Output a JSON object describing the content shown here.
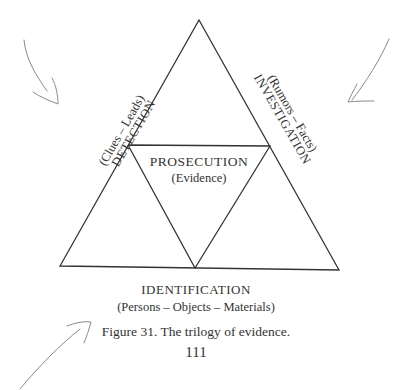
{
  "diagram": {
    "type": "triangle-subdivided",
    "inner_label": {
      "title": "PROSECUTION",
      "subtitle": "(Evidence)"
    },
    "left_side": {
      "title": "DETECTION",
      "subtitle": "(Clues – Leads)"
    },
    "right_side": {
      "title": "INVESTIGATION",
      "subtitle": "(Rumors – Facts)"
    },
    "bottom": {
      "title": "IDENTIFICATION",
      "subtitle": "(Persons – Objects – Materials)"
    },
    "handwritten_marks": [
      "arrow-down-right-top-left",
      "arrow-down-left-top-right",
      "arrow-up-right-bottom-left"
    ]
  },
  "caption": "Figure 31.  The trilogy of evidence.",
  "page_number": "111",
  "colors": {
    "ink": "#333333",
    "pencil": "#8a8a8a",
    "paper": "#ffffff"
  }
}
